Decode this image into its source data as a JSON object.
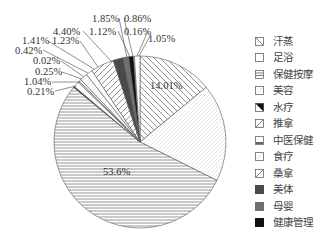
{
  "chart_data": {
    "type": "pie",
    "title": "",
    "start_angle_deg": 0,
    "direction": "clockwise",
    "legend_position": "right",
    "legend": [
      "汗蒸",
      "足浴",
      "保健按摩",
      "美容",
      "水疗",
      "推拿",
      "中医保健",
      "食疗",
      "桑拿",
      "美体",
      "母婴",
      "健康管理"
    ],
    "slices": [
      {
        "category": "汗蒸",
        "value": 14.01,
        "label": "14.01%",
        "pattern": "diag-back"
      },
      {
        "category": "足浴",
        "value": 18.37,
        "label": "",
        "pattern": "dots"
      },
      {
        "category": "保健按摩",
        "value": 53.6,
        "label": "53.6%",
        "pattern": "hlines"
      },
      {
        "category": "水疗",
        "value": 0.21,
        "label": "0.21%",
        "pattern": "black"
      },
      {
        "category": "中医保健",
        "value": 1.04,
        "label": "1.04%",
        "pattern": "white"
      },
      {
        "category": "食疗",
        "value": 0.25,
        "label": "0.25%",
        "pattern": "white"
      },
      {
        "category": "桑拿",
        "value": 0.02,
        "label": "0.02%",
        "pattern": "white"
      },
      {
        "category": "美容",
        "value": 0.42,
        "label": "0.42%",
        "pattern": "white"
      },
      {
        "category": "食疗",
        "value": 1.41,
        "label": "1.41%",
        "pattern": "dots"
      },
      {
        "category": "中医保健",
        "value": 1.23,
        "label": "1.23%",
        "pattern": "white"
      },
      {
        "category": "推拿",
        "value": 4.4,
        "label": "4.40%",
        "pattern": "diag-fwd"
      },
      {
        "category": "美体",
        "value": 1.85,
        "label": "1.85%",
        "pattern": "dark"
      },
      {
        "category": "母婴",
        "value": 1.12,
        "label": "1.12%",
        "pattern": "gray"
      },
      {
        "category": "健康管理",
        "value": 0.86,
        "label": "0.86%",
        "pattern": "black"
      },
      {
        "category": "桑拿",
        "value": 0.16,
        "label": "0.16%",
        "pattern": "white"
      },
      {
        "category": "美容",
        "value": 1.05,
        "label": "1.05%",
        "pattern": "white"
      }
    ]
  },
  "pie": {
    "cx": 140,
    "cy": 142,
    "r": 86
  },
  "inner_labels": [
    {
      "text": "14.01%",
      "x": 150,
      "y": 89
    },
    {
      "text": "53.6%",
      "x": 103,
      "y": 175
    }
  ],
  "outer_labels": [
    {
      "text": "1.85%",
      "x": 92,
      "y": 22,
      "lx": 119,
      "ly": 18,
      "tx": 127,
      "ty": 58
    },
    {
      "text": "0.86%",
      "x": 124,
      "y": 22,
      "lx": 124,
      "ly": 18,
      "tx": 133,
      "ty": 57
    },
    {
      "text": "4.40%",
      "x": 53,
      "y": 35,
      "lx": 83,
      "ly": 31,
      "tx": 112,
      "ty": 62
    },
    {
      "text": "1.12%",
      "x": 89,
      "y": 35,
      "lx": 118,
      "ly": 31,
      "tx": 130,
      "ty": 57
    },
    {
      "text": "0.16%",
      "x": 124,
      "y": 35,
      "lx": 148,
      "ly": 31,
      "tx": 137,
      "ty": 56
    },
    {
      "text": "1.05%",
      "x": 148,
      "y": 42,
      "lx": 150,
      "ly": 36,
      "tx": 139,
      "ty": 56
    },
    {
      "text": "1.41%",
      "x": 22,
      "y": 44,
      "lx": 48,
      "ly": 41,
      "tx": 94,
      "ty": 69
    },
    {
      "text": "1.23%",
      "x": 52,
      "y": 44,
      "lx": 80,
      "ly": 41,
      "tx": 98,
      "ty": 67
    },
    {
      "text": "0.42%",
      "x": 15,
      "y": 54,
      "lx": 43,
      "ly": 50,
      "tx": 88,
      "ty": 73
    },
    {
      "text": "0.02%",
      "x": 33,
      "y": 64,
      "lx": 61,
      "ly": 61,
      "tx": 84,
      "ty": 77
    },
    {
      "text": "0.25%",
      "x": 35,
      "y": 75,
      "lx": 62,
      "ly": 72,
      "tx": 82,
      "ty": 79
    },
    {
      "text": "1.04%",
      "x": 24,
      "y": 85,
      "lx": 52,
      "ly": 82,
      "tx": 80,
      "ty": 82
    },
    {
      "text": "0.21%",
      "x": 27,
      "y": 95,
      "lx": 55,
      "ly": 91,
      "tx": 76,
      "ty": 86
    }
  ],
  "legend": [
    {
      "label": "汗蒸",
      "pattern": "diag-back"
    },
    {
      "label": "足浴",
      "pattern": "white"
    },
    {
      "label": "保健按摩",
      "pattern": "hlines"
    },
    {
      "label": "美容",
      "pattern": "dots"
    },
    {
      "label": "水疗",
      "pattern": "half-black"
    },
    {
      "label": "推拿",
      "pattern": "diag-fwd"
    },
    {
      "label": "中医保健",
      "pattern": "base-line"
    },
    {
      "label": "食疗",
      "pattern": "dots"
    },
    {
      "label": "桑拿",
      "pattern": "diag-fwd"
    },
    {
      "label": "美体",
      "pattern": "dark"
    },
    {
      "label": "母婴",
      "pattern": "gray"
    },
    {
      "label": "健康管理",
      "pattern": "black"
    }
  ],
  "colors": {
    "stroke": "#555555",
    "dark": "#4a4a4a",
    "gray": "#707070",
    "black": "#111111",
    "hatch": "#777777"
  }
}
